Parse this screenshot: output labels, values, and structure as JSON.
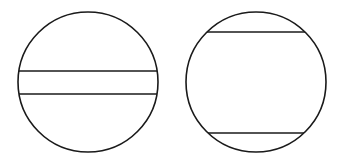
{
  "diagram": {
    "stroke_color": "#1a1a1a",
    "background": "#ffffff",
    "figures": [
      {
        "name": "circle-with-central-chords",
        "circle": {
          "cx": 88,
          "cy": 82,
          "r": 70
        },
        "chords_y": [
          71,
          94
        ]
      },
      {
        "name": "circle-with-outer-chords",
        "circle": {
          "cx": 256,
          "cy": 82,
          "r": 70
        },
        "chords_y": [
          32,
          133
        ]
      }
    ]
  }
}
